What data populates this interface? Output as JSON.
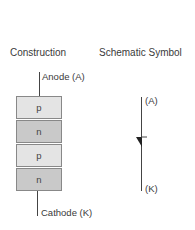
{
  "headings": {
    "construction": "Construction",
    "schematic": "Schematic Symbol"
  },
  "construction": {
    "anode_label": "Anode (A)",
    "cathode_label": "Cathode (K)",
    "layers": [
      "p",
      "n",
      "p",
      "n"
    ]
  },
  "schematic": {
    "anode_label": "(A)",
    "cathode_label": "(K)"
  },
  "colors": {
    "p_layer": "#e4e4e4",
    "n_layer": "#c9c9c9",
    "line": "#444444"
  }
}
